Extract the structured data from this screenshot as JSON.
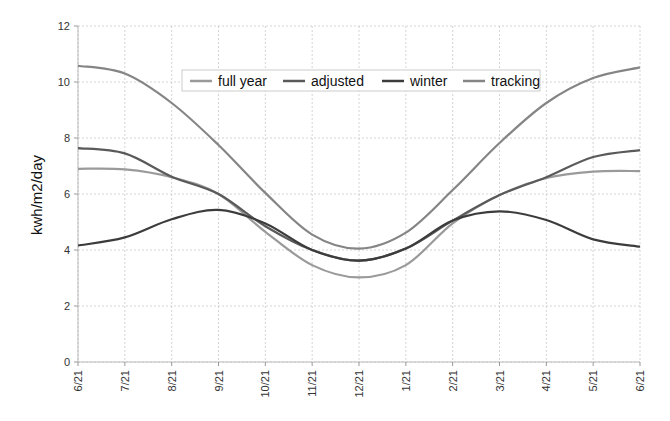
{
  "chart_data": {
    "type": "line",
    "title": "",
    "xlabel": "",
    "ylabel": "kwh/m2/day",
    "ylim": [
      0,
      12
    ],
    "yticks": [
      0,
      2,
      4,
      6,
      8,
      10,
      12
    ],
    "grid": true,
    "legend_position": "top-center (inside plot)",
    "x": [
      "6/21",
      "7/21",
      "8/21",
      "9/21",
      "10/21",
      "11/21",
      "12/21",
      "1/21",
      "2/21",
      "3/21",
      "4/21",
      "5/21",
      "6/21"
    ],
    "series": [
      {
        "name": "full year",
        "color": "#9a9a9a",
        "values": [
          6.9,
          6.88,
          6.6,
          6.0,
          4.65,
          3.46,
          3.02,
          3.46,
          4.95,
          5.96,
          6.57,
          6.8,
          6.82
        ]
      },
      {
        "name": "adjusted",
        "color": "#5a5a5a",
        "values": [
          7.64,
          7.45,
          6.62,
          6.0,
          4.85,
          4.0,
          3.62,
          4.05,
          5.05,
          5.96,
          6.6,
          7.32,
          7.57
        ]
      },
      {
        "name": "winter",
        "color": "#3c3c3c",
        "values": [
          4.16,
          4.45,
          5.1,
          5.43,
          4.95,
          4.0,
          3.62,
          4.05,
          5.05,
          5.38,
          5.07,
          4.38,
          4.12
        ]
      },
      {
        "name": "tracking",
        "color": "#858585",
        "values": [
          10.58,
          10.3,
          9.25,
          7.75,
          6.04,
          4.55,
          4.05,
          4.62,
          6.14,
          7.82,
          9.25,
          10.14,
          10.52
        ]
      }
    ]
  },
  "labels": {
    "ylabel": "kwh/m2/day",
    "legend": [
      "full year",
      "adjusted",
      "winter",
      "tracking"
    ]
  }
}
